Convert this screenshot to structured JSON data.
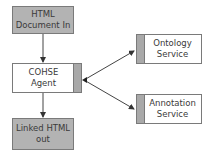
{
  "diagram": {
    "nodes": [
      {
        "id": "html-in",
        "line1": "HTML",
        "line2": "Document In",
        "style": "gray"
      },
      {
        "id": "cohse-agent",
        "line1": "COHSE",
        "line2": "Agent",
        "style": "white-strip-right"
      },
      {
        "id": "linked-out",
        "line1": "Linked HTML",
        "line2": "out",
        "style": "gray"
      },
      {
        "id": "ontology-service",
        "line1": "Ontology",
        "line2": "Service",
        "style": "white-strip-left"
      },
      {
        "id": "annotation-service",
        "line1": "Annotation",
        "line2": "Service",
        "style": "white-strip-left"
      }
    ],
    "edges": [
      {
        "from": "html-in",
        "to": "cohse-agent"
      },
      {
        "from": "cohse-agent",
        "to": "linked-out"
      },
      {
        "from": "cohse-agent",
        "to": "ontology-service",
        "bidirectional": true
      },
      {
        "from": "cohse-agent",
        "to": "annotation-service",
        "bidirectional": true
      }
    ]
  }
}
